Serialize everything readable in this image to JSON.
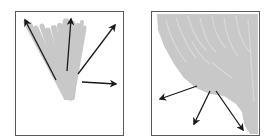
{
  "figure": {
    "panels": [
      {
        "id": "left",
        "label": "Fan-shaped stroke bundle with outward arrows",
        "blob_color": "#c8c8c8",
        "arrow_color": "#1a1a1a",
        "arrows": [
          {
            "name": "up-left",
            "x1": 40,
            "y1": 68,
            "x2": 9,
            "y2": 8
          },
          {
            "name": "up",
            "x1": 51,
            "y1": 59,
            "x2": 55,
            "y2": 7
          },
          {
            "name": "up-right",
            "x1": 62,
            "y1": 62,
            "x2": 99,
            "y2": 13
          },
          {
            "name": "right",
            "x1": 66,
            "y1": 70,
            "x2": 100,
            "y2": 72
          }
        ]
      },
      {
        "id": "right",
        "label": "Dense stroke mass with downward arrows",
        "blob_color": "#c8c8c8",
        "arrow_color": "#1a1a1a",
        "arrows": [
          {
            "name": "down-left",
            "x1": 45,
            "y1": 74,
            "x2": 8,
            "y2": 87
          },
          {
            "name": "down",
            "x1": 58,
            "y1": 79,
            "x2": 42,
            "y2": 112
          },
          {
            "name": "down-right",
            "x1": 64,
            "y1": 79,
            "x2": 91,
            "y2": 118
          }
        ]
      }
    ],
    "border_color": "#5a5a5a"
  }
}
